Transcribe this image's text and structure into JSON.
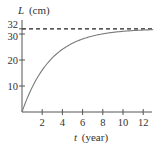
{
  "chart_data": {
    "type": "line",
    "title": "",
    "xlabel": "t (year)",
    "ylabel": "L (cm)",
    "xlabel_var": "t",
    "xlabel_unit": "(year)",
    "ylabel_var": "L",
    "ylabel_unit": "(cm)",
    "xlim": [
      0,
      13
    ],
    "ylim": [
      0,
      34
    ],
    "x_ticks": [
      2,
      4,
      6,
      8,
      10,
      12
    ],
    "y_ticks": [
      10,
      20,
      30,
      32
    ],
    "grid": false,
    "legend": null,
    "asymptote": {
      "y": 32,
      "style": "dashed"
    },
    "series": [
      {
        "name": "L(t) = 32(1 - e^(-0.35t))",
        "x": [
          0,
          1,
          2,
          3,
          4,
          5,
          6,
          7,
          8,
          9,
          10,
          11,
          12,
          13
        ],
        "values": [
          0,
          9.4,
          16.1,
          20.8,
          24.1,
          26.4,
          28.0,
          29.2,
          30.0,
          30.6,
          31.0,
          31.3,
          31.5,
          31.7
        ]
      }
    ],
    "colors": {
      "curve": "#777777",
      "axes": "#444444",
      "dashed": "#222222"
    }
  }
}
